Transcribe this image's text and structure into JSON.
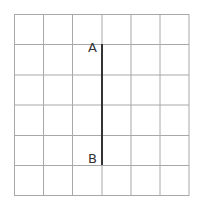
{
  "diagram": {
    "grid": {
      "cols": 6,
      "rows": 6,
      "line_color": "#a0a0a0"
    },
    "segment": {
      "from": "A",
      "to": "B",
      "color": "#333333"
    },
    "labels": {
      "a": "A",
      "b": "B"
    }
  }
}
